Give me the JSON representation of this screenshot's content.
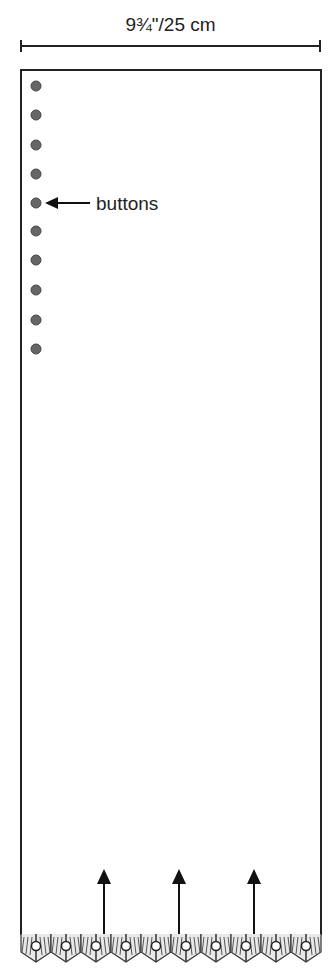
{
  "diagram": {
    "type": "knitting-schematic",
    "width_dimension": "9¾\"/25 cm",
    "buttons_label": "buttons",
    "button_count": 10,
    "button_positions_y": [
      86,
      115,
      145,
      174,
      203,
      231,
      260,
      290,
      320,
      349
    ],
    "direction_arrow_count": 3,
    "edging_scallop_count": 10,
    "colors": {
      "line": "#222222",
      "button_fill": "#666666",
      "background": "#ffffff"
    }
  }
}
